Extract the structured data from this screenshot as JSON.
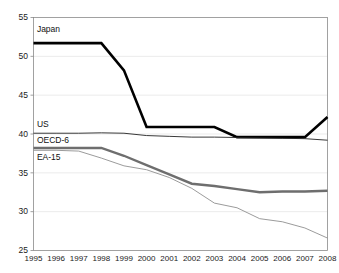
{
  "chart_data": {
    "type": "line",
    "title": "",
    "subtitle": "",
    "xlabel": "",
    "ylabel": "",
    "grid": true,
    "legend_position": "inline-labels",
    "x": [
      1995,
      1996,
      1997,
      1998,
      1999,
      2000,
      2001,
      2002,
      2003,
      2004,
      2005,
      2006,
      2007,
      2008
    ],
    "categories": [
      "1995",
      "1996",
      "1997",
      "1998",
      "1999",
      "2000",
      "2001",
      "2002",
      "2003",
      "2004",
      "2005",
      "2006",
      "2007",
      "2008"
    ],
    "xlim": [
      1995,
      2008
    ],
    "ylim": [
      25,
      55
    ],
    "yticks": [
      25,
      30,
      35,
      40,
      45,
      50,
      55
    ],
    "ytick_labels": [
      "25",
      "30",
      "35",
      "40",
      "45",
      "50",
      "55"
    ],
    "series": [
      {
        "name": "Japan",
        "color": "#000000",
        "width": 2.6,
        "label_x": 1995.15,
        "label_y": 53.1,
        "values": [
          51.7,
          51.7,
          51.7,
          51.7,
          48.2,
          40.9,
          40.9,
          40.9,
          40.9,
          39.6,
          39.6,
          39.6,
          39.6,
          42.2
        ]
      },
      {
        "name": "US",
        "color": "#222222",
        "width": 0.9,
        "label_x": 1995.15,
        "label_y": 40.9,
        "values": [
          40.1,
          40.1,
          40.1,
          40.15,
          40.1,
          39.8,
          39.7,
          39.6,
          39.6,
          39.55,
          39.5,
          39.45,
          39.4,
          39.2
        ]
      },
      {
        "name": "OECD-6",
        "color": "#6e6e6e",
        "width": 2.4,
        "label_x": 1995.15,
        "label_y": 38.9,
        "values": [
          38.2,
          38.2,
          38.2,
          38.2,
          37.2,
          36.0,
          34.8,
          33.6,
          33.3,
          32.9,
          32.5,
          32.6,
          32.6,
          32.7
        ]
      },
      {
        "name": "EA-15",
        "color": "#909090",
        "width": 0.9,
        "label_x": 1995.15,
        "label_y": 36.6,
        "values": [
          37.9,
          37.9,
          37.8,
          36.9,
          35.9,
          35.4,
          34.4,
          33.0,
          31.1,
          30.5,
          29.1,
          28.7,
          27.9,
          26.6
        ]
      }
    ]
  }
}
